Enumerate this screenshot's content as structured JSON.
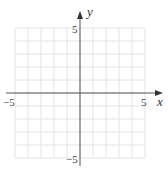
{
  "chart_data": {
    "type": "scatter",
    "title": "",
    "xlabel": "x",
    "ylabel": "y",
    "xlim": [
      -5,
      5
    ],
    "ylim": [
      -5,
      5
    ],
    "grid": true,
    "grid_step": 1,
    "x_tick_labels": [
      "-5",
      "5"
    ],
    "y_tick_labels": [
      "5",
      "-5"
    ],
    "series": [],
    "legend": null
  },
  "labels": {
    "x_axis": "x",
    "y_axis": "y",
    "x_min": "−5",
    "x_max": "5",
    "y_max": "5",
    "y_min": "−5"
  },
  "colors": {
    "grid": "#e4e4e4",
    "axis": "#555555",
    "text": "#444444"
  }
}
